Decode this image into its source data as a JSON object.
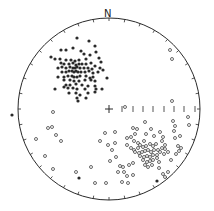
{
  "diagram": {
    "type": "stereonet",
    "north_label": "N",
    "center": [
      109,
      109
    ],
    "radius": 91,
    "colors": {
      "ink": "#2a2a2a",
      "background": "#ffffff"
    },
    "scale_bar": {
      "y": 109,
      "ticks_x": [
        122,
        133,
        143,
        153,
        164,
        174,
        184,
        195
      ]
    },
    "filled_points": [
      [
        77,
        38
      ],
      [
        89,
        41
      ],
      [
        61,
        50
      ],
      [
        66,
        50
      ],
      [
        73,
        48
      ],
      [
        81,
        51
      ],
      [
        95,
        46
      ],
      [
        96,
        52
      ],
      [
        84,
        54
      ],
      [
        90,
        55
      ],
      [
        51,
        57
      ],
      [
        55,
        59
      ],
      [
        60,
        59
      ],
      [
        66,
        60
      ],
      [
        71,
        60
      ],
      [
        75,
        61
      ],
      [
        79,
        60
      ],
      [
        86,
        59
      ],
      [
        99,
        58
      ],
      [
        101,
        62
      ],
      [
        61,
        63
      ],
      [
        64,
        64
      ],
      [
        69,
        64
      ],
      [
        73,
        63
      ],
      [
        76,
        65
      ],
      [
        79,
        64
      ],
      [
        82,
        64
      ],
      [
        86,
        64
      ],
      [
        91,
        63
      ],
      [
        95,
        66
      ],
      [
        58,
        68
      ],
      [
        62,
        67
      ],
      [
        66,
        68
      ],
      [
        70,
        67
      ],
      [
        73,
        68
      ],
      [
        75,
        68
      ],
      [
        77,
        67
      ],
      [
        80,
        68
      ],
      [
        84,
        68
      ],
      [
        88,
        68
      ],
      [
        92,
        69
      ],
      [
        100,
        68
      ],
      [
        103,
        70
      ],
      [
        62,
        72
      ],
      [
        66,
        72
      ],
      [
        69,
        71
      ],
      [
        72,
        71
      ],
      [
        74,
        72
      ],
      [
        76,
        71
      ],
      [
        78,
        72
      ],
      [
        81,
        72
      ],
      [
        85,
        72
      ],
      [
        89,
        71
      ],
      [
        93,
        73
      ],
      [
        98,
        72
      ],
      [
        58,
        77
      ],
      [
        64,
        77
      ],
      [
        68,
        76
      ],
      [
        72,
        76
      ],
      [
        74,
        77
      ],
      [
        77,
        77
      ],
      [
        80,
        76
      ],
      [
        86,
        76
      ],
      [
        90,
        78
      ],
      [
        93,
        77
      ],
      [
        107,
        78
      ],
      [
        64,
        80
      ],
      [
        70,
        80
      ],
      [
        74,
        81
      ],
      [
        79,
        81
      ],
      [
        85,
        80
      ],
      [
        91,
        80
      ],
      [
        95,
        81
      ],
      [
        66,
        85
      ],
      [
        70,
        85
      ],
      [
        76,
        84
      ],
      [
        82,
        85
      ],
      [
        88,
        86
      ],
      [
        95,
        86
      ],
      [
        55,
        89
      ],
      [
        64,
        87
      ],
      [
        68,
        88
      ],
      [
        73,
        88
      ],
      [
        77,
        89
      ],
      [
        85,
        89
      ],
      [
        96,
        89
      ],
      [
        102,
        89
      ],
      [
        69,
        93
      ],
      [
        76,
        93
      ],
      [
        80,
        95
      ],
      [
        88,
        93
      ],
      [
        95,
        92
      ],
      [
        77,
        98
      ],
      [
        86,
        98
      ],
      [
        78,
        101
      ],
      [
        12,
        115
      ],
      [
        79,
        178
      ],
      [
        157,
        181
      ]
    ],
    "open_points": [
      [
        170,
        50
      ],
      [
        172,
        59
      ],
      [
        172,
        101
      ],
      [
        125,
        107
      ],
      [
        188,
        117
      ],
      [
        145,
        122
      ],
      [
        173,
        121
      ],
      [
        175,
        126
      ],
      [
        189,
        125
      ],
      [
        53,
        112
      ],
      [
        48,
        128
      ],
      [
        52,
        127
      ],
      [
        56,
        135
      ],
      [
        36,
        139
      ],
      [
        61,
        141
      ],
      [
        45,
        156
      ],
      [
        53,
        169
      ],
      [
        91,
        167
      ],
      [
        76,
        172
      ],
      [
        95,
        183
      ],
      [
        106,
        183
      ],
      [
        122,
        182
      ],
      [
        128,
        183
      ],
      [
        124,
        172
      ],
      [
        127,
        176
      ],
      [
        118,
        172
      ],
      [
        133,
        175
      ],
      [
        105,
        133
      ],
      [
        115,
        132
      ],
      [
        100,
        141
      ],
      [
        108,
        145
      ],
      [
        115,
        143
      ],
      [
        112,
        150
      ],
      [
        116,
        157
      ],
      [
        110,
        161
      ],
      [
        120,
        166
      ],
      [
        123,
        167
      ],
      [
        133,
        128
      ],
      [
        137,
        129
      ],
      [
        135,
        134
      ],
      [
        131,
        137
      ],
      [
        127,
        138
      ],
      [
        134,
        141
      ],
      [
        138,
        143
      ],
      [
        144,
        141
      ],
      [
        146,
        134
      ],
      [
        151,
        129
      ],
      [
        154,
        136
      ],
      [
        127,
        145
      ],
      [
        131,
        148
      ],
      [
        134,
        150
      ],
      [
        138,
        148
      ],
      [
        140,
        145
      ],
      [
        143,
        147
      ],
      [
        146,
        146
      ],
      [
        150,
        144
      ],
      [
        153,
        146
      ],
      [
        156,
        144
      ],
      [
        135,
        152
      ],
      [
        139,
        153
      ],
      [
        142,
        152
      ],
      [
        145,
        151
      ],
      [
        148,
        150
      ],
      [
        151,
        152
      ],
      [
        154,
        150
      ],
      [
        158,
        150
      ],
      [
        162,
        148
      ],
      [
        140,
        156
      ],
      [
        144,
        157
      ],
      [
        147,
        156
      ],
      [
        150,
        157
      ],
      [
        153,
        155
      ],
      [
        157,
        155
      ],
      [
        160,
        152
      ],
      [
        165,
        149
      ],
      [
        143,
        160
      ],
      [
        147,
        162
      ],
      [
        150,
        161
      ],
      [
        153,
        160
      ],
      [
        157,
        158
      ],
      [
        164,
        154
      ],
      [
        168,
        152
      ],
      [
        145,
        165
      ],
      [
        148,
        167
      ],
      [
        152,
        165
      ],
      [
        159,
        162
      ],
      [
        162,
        141
      ],
      [
        163,
        137
      ],
      [
        160,
        132
      ],
      [
        165,
        145
      ],
      [
        174,
        131
      ],
      [
        175,
        138
      ],
      [
        180,
        136
      ],
      [
        178,
        146
      ],
      [
        181,
        148
      ],
      [
        176,
        154
      ],
      [
        171,
        160
      ],
      [
        179,
        151
      ],
      [
        159,
        168
      ],
      [
        163,
        174
      ],
      [
        165,
        177
      ],
      [
        168,
        172
      ],
      [
        133,
        163
      ],
      [
        129,
        165
      ]
    ]
  }
}
